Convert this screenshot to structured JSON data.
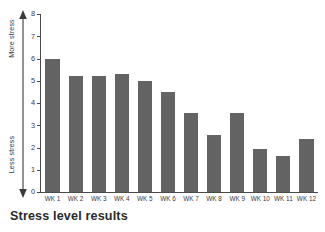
{
  "caption": "Stress level results",
  "axis": {
    "vertical_arrow_icon": "double-headed-vertical-arrow",
    "top_label": "More stress",
    "bottom_label": "Less stress",
    "y_ticks": [
      "0",
      "1",
      "2",
      "3",
      "4",
      "5",
      "6",
      "7",
      "8"
    ]
  },
  "colors": {
    "bar": "#636363",
    "axis": "#4a4a4a",
    "text": "#3a3a3a",
    "background": "#ffffff"
  },
  "chart_data": {
    "type": "bar",
    "title": "Stress level results",
    "xlabel": "",
    "ylabel": "",
    "ylim": [
      0,
      8
    ],
    "yticks": [
      0,
      1,
      2,
      3,
      4,
      5,
      6,
      7,
      8
    ],
    "grid": false,
    "legend": "none",
    "annotations": [
      "More stress",
      "Less stress"
    ],
    "categories": [
      "WK 1",
      "WK 2",
      "WK 3",
      "WK 4",
      "WK 5",
      "WK 6",
      "WK 7",
      "WK 8",
      "WK 9",
      "WK 10",
      "WK 11",
      "WK 12"
    ],
    "values": [
      6.0,
      5.2,
      5.2,
      5.3,
      5.0,
      4.5,
      3.55,
      2.55,
      3.55,
      1.95,
      1.6,
      2.4
    ]
  }
}
